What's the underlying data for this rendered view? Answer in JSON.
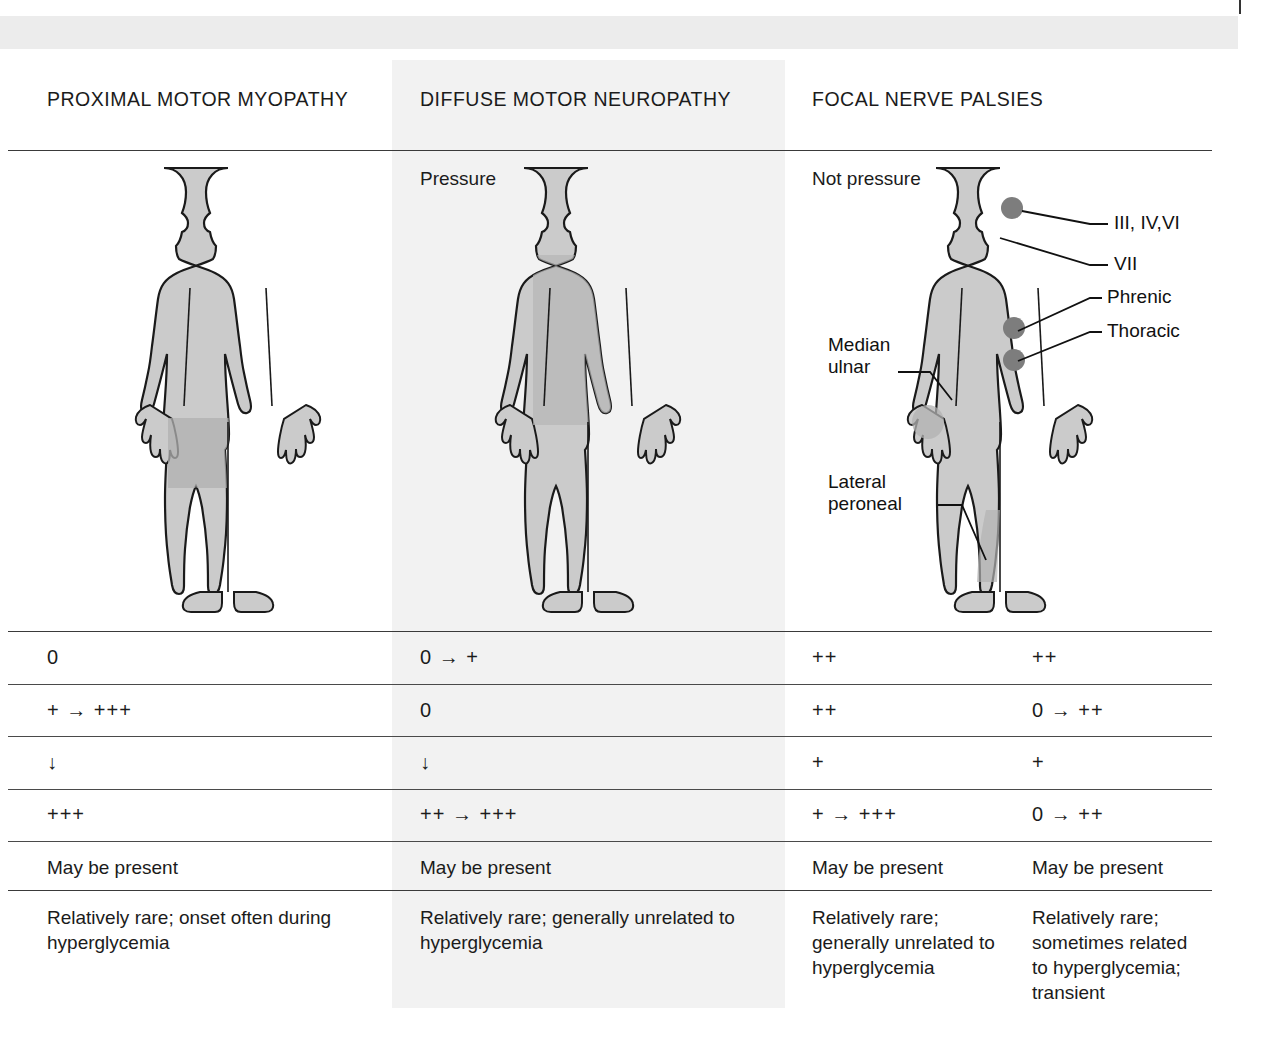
{
  "document": {
    "type": "medical-comparison-table",
    "columns": [
      {
        "id": "col0",
        "header": "PROXIMAL MOTOR MYOPATHY",
        "caption": ""
      },
      {
        "id": "col1",
        "header": "DIFFUSE MOTOR NEUROPATHY",
        "caption": "Pressure"
      },
      {
        "id": "col2",
        "header": "FOCAL NERVE PALSIES",
        "caption": "Not pressure"
      },
      {
        "id": "col3",
        "header": "",
        "caption": ""
      }
    ],
    "figures": [
      {
        "name": "body-figure-proximal-motor-myopathy",
        "column": 0,
        "highlight": "proximal thighs"
      },
      {
        "name": "body-figure-diffuse-motor-neuropathy",
        "column": 1,
        "highlight": "whole body"
      },
      {
        "name": "body-figure-focal-nerve-palsies",
        "column": 2,
        "highlight": "focal nerve points"
      }
    ],
    "annotations": [
      {
        "id": "cranial-nerves",
        "label": "III, IV,VI"
      },
      {
        "id": "facial-nerve",
        "label": "VII"
      },
      {
        "id": "phrenic-nerve",
        "label": "Phrenic"
      },
      {
        "id": "thoracic-nerve",
        "label": "Thoracic"
      },
      {
        "id": "median-ulnar-nerve",
        "label": "Median\nulnar"
      },
      {
        "id": "median-ulnar-line1",
        "label": "Median"
      },
      {
        "id": "median-ulnar-line2",
        "label": "ulnar"
      },
      {
        "id": "lateral-peroneal-line1",
        "label": "Lateral"
      },
      {
        "id": "lateral-peroneal-line2",
        "label": "peroneal"
      }
    ],
    "rows": [
      {
        "id": "row-sensory-loss",
        "cells": [
          "0",
          "0 → +",
          "++",
          "++"
        ]
      },
      {
        "id": "row-weakness",
        "cells": [
          "+ → +++",
          "0",
          "++",
          "0 → ++"
        ]
      },
      {
        "id": "row-reflexes",
        "cells": [
          "↓",
          "↓",
          "+",
          "+"
        ]
      },
      {
        "id": "row-pain",
        "cells": [
          "+++",
          "++ → +++",
          "+ → +++",
          "0 → ++"
        ]
      },
      {
        "id": "row-autonomic",
        "cells": [
          "May be present",
          "May be present",
          "May be present",
          "May be present"
        ]
      },
      {
        "id": "row-comments",
        "cells": [
          "Relatively rare; onset often during hyperglycemia",
          "Relatively rare; generally unrelated to hyperglycemia",
          "Relatively rare; generally unrelated to hyperglycemia",
          "Relatively rare; sometimes related to hyperglycemia; transient"
        ]
      }
    ]
  },
  "colors": {
    "page_background": "#ffffff",
    "shaded_column": "#f2f2f2",
    "top_bar": "#ececec",
    "body_fill": "#c9c9c9",
    "body_fill_dark": "#b3b3b3",
    "nerve_dot": "#7d7d7d",
    "rule": "#3a3a3a",
    "text": "#1b1b1b"
  }
}
